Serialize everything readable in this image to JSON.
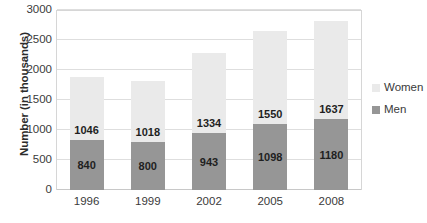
{
  "chart_data": {
    "type": "bar",
    "subtype": "stacked-column",
    "title": "",
    "xlabel": "",
    "ylabel": "Number (in thousands)",
    "categories": [
      "1996",
      "1999",
      "2002",
      "2005",
      "2008"
    ],
    "series": [
      {
        "name": "Men",
        "color": "#969696",
        "values": [
          840,
          800,
          943,
          1098,
          1180
        ]
      },
      {
        "name": "Women",
        "color": "#eaeaea",
        "values": [
          1046,
          1018,
          1334,
          1550,
          1637
        ]
      }
    ],
    "totals": [
      1886,
      1818,
      2277,
      2648,
      2817
    ],
    "ylim": [
      0,
      3000
    ],
    "yticks": [
      0,
      500,
      1000,
      1500,
      2000,
      2500,
      3000
    ],
    "ytick_labels": [
      "0",
      "500",
      "1000",
      "1500",
      "2000",
      "2500",
      "3000"
    ],
    "grid": true,
    "grid_axis": "y",
    "legend_position": "right",
    "data_labels": true
  },
  "legend": {
    "items": [
      {
        "label": "Women",
        "color": "#eaeaea"
      },
      {
        "label": "Men",
        "color": "#969696"
      }
    ]
  }
}
